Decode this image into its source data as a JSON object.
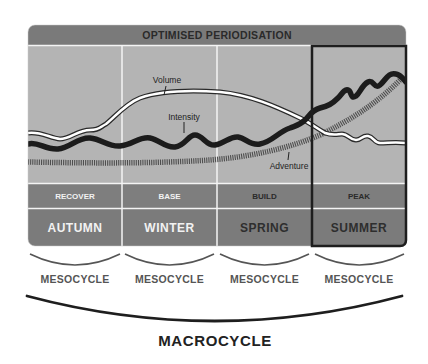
{
  "title": "OPTIMISED PERIODISATION",
  "colors": {
    "header_bg": "#7a7a7a",
    "chart_bg": "#b3b3b3",
    "row_bg": "#7d7d7d",
    "divider": "#f5f5f5",
    "highlight_border": "#1e1e1e",
    "volume_line": "#ffffff",
    "volume_outline": "#2a2a2a",
    "intensity_line": "#1e1e1e",
    "adventure_line": "#5a5a5a"
  },
  "series_labels": {
    "volume": "Volume",
    "intensity": "Intensity",
    "adventure": "Adventure"
  },
  "columns": [
    {
      "phase": "RECOVER",
      "season": "AUTUMN",
      "highlighted": false
    },
    {
      "phase": "BASE",
      "season": "WINTER",
      "highlighted": false
    },
    {
      "phase": "BUILD",
      "season": "SPRING",
      "highlighted": false
    },
    {
      "phase": "PEAK",
      "season": "SUMMER",
      "highlighted": true
    }
  ],
  "mesocycles": [
    "MESOCYCLE",
    "MESOCYCLE",
    "MESOCYCLE",
    "MESOCYCLE"
  ],
  "macrocycle": "MACROCYCLE"
}
